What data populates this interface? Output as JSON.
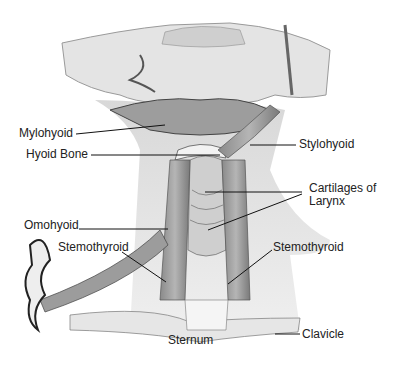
{
  "figure": {
    "labels": [
      {
        "id": "mylohyoid",
        "text": "Mylohyoid",
        "x": 19,
        "y": 127
      },
      {
        "id": "hyoid-bone",
        "text": "Hyoid Bone",
        "x": 26,
        "y": 148
      },
      {
        "id": "stylohyoid",
        "text": "Stylohyoid",
        "x": 299,
        "y": 138
      },
      {
        "id": "cartilages-of-larynx-line1",
        "text": "Cartilages of",
        "x": 309,
        "y": 182
      },
      {
        "id": "cartilages-of-larynx-line2",
        "text": "Larynx",
        "x": 309,
        "y": 195
      },
      {
        "id": "omohyoid",
        "text": "Omohyoid",
        "x": 24,
        "y": 219
      },
      {
        "id": "sternothyroid-left",
        "text": "Stemothyroid",
        "x": 58,
        "y": 241
      },
      {
        "id": "sternothyroid-right",
        "text": "Stemothyroid",
        "x": 273,
        "y": 241
      },
      {
        "id": "sternum",
        "text": "Sternum",
        "x": 168,
        "y": 334
      },
      {
        "id": "clavicle",
        "text": "Clavicle",
        "x": 302,
        "y": 328
      }
    ]
  }
}
